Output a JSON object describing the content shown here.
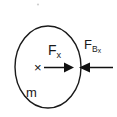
{
  "figure": {
    "type": "free-body-diagram",
    "width": 117,
    "height": 117,
    "background_color": "#ffffff",
    "stroke_color": "#1a1a1a"
  },
  "body": {
    "shape": "circle",
    "mass_label": "m",
    "center_of_mass_marker": "×",
    "center_x": 48,
    "center_y": 67,
    "radius_x": 33,
    "radius_y": 41
  },
  "forces": [
    {
      "name": "applied-force",
      "label_base": "F",
      "label_sub": "x",
      "label_plain": "Fx",
      "direction": "right",
      "tail_x": 44,
      "tip_x": 72,
      "y": 67
    },
    {
      "name": "reaction-force",
      "label_base": "F",
      "label_sub": "B",
      "label_sub_sub": "x",
      "label_plain": "FBx",
      "direction": "left",
      "tail_x": 113,
      "tip_x": 78,
      "y": 67
    }
  ],
  "artifacts": {
    "speck_label": "·",
    "speck_x": 38,
    "speck_y": 4
  }
}
